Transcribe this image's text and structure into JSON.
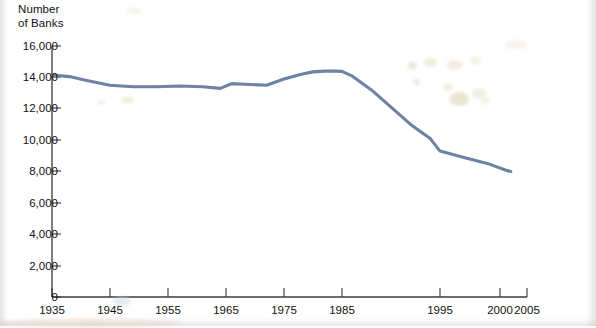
{
  "chart_data": {
    "type": "line",
    "title": "",
    "ylabel": "Number\nof Banks",
    "xlabel": "",
    "ylim": [
      0,
      16000
    ],
    "xlim": [
      1935,
      2005
    ],
    "grid": false,
    "legend": null,
    "y_ticks": [
      "16,000",
      "14,000",
      "12,000",
      "10,000",
      "8,000",
      "6,000",
      "4,000",
      "2,000",
      "0"
    ],
    "y_tick_values": [
      16000,
      14000,
      12000,
      10000,
      8000,
      6000,
      4000,
      2000,
      0
    ],
    "x_ticks": [
      "1935",
      "1945",
      "1955",
      "1965",
      "1975",
      "1985",
      "1995",
      "2000",
      "2005"
    ],
    "x_tick_values": [
      1935,
      1945,
      1955,
      1965,
      1975,
      1985,
      1995,
      2000,
      2005
    ],
    "series_name": "Number of Banks",
    "line_color": "#6e83a3",
    "x": [
      1935,
      1938,
      1941,
      1945,
      1949,
      1953,
      1957,
      1961,
      1964,
      1966,
      1969,
      1972,
      1975,
      1978,
      1980,
      1982,
      1984,
      1985,
      1986,
      1988,
      1990,
      1992,
      1994,
      1995,
      1997,
      1999,
      2001,
      2002
    ],
    "values": [
      14150,
      14050,
      13800,
      13500,
      13400,
      13400,
      13450,
      13400,
      13300,
      13600,
      13550,
      13500,
      13900,
      14200,
      14350,
      14400,
      14400,
      14380,
      14100,
      13200,
      12100,
      11000,
      10100,
      9300,
      8900,
      8500,
      8100,
      8000
    ]
  },
  "annotations": {
    "ylabel_line1": "Number",
    "ylabel_line2": "of Banks"
  }
}
